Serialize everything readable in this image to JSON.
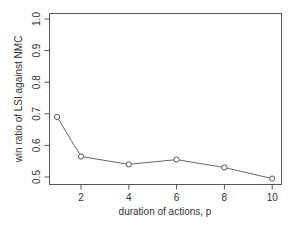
{
  "chart_data": {
    "type": "line",
    "title": "",
    "xlabel": "duration of actions, p",
    "ylabel": "win ratio of LSI against NMC",
    "x": [
      1,
      2,
      4,
      6,
      8,
      10
    ],
    "series": [
      {
        "name": "win ratio",
        "values": [
          0.69,
          0.565,
          0.54,
          0.555,
          0.53,
          0.495
        ]
      }
    ],
    "xticks": [
      2,
      4,
      6,
      8,
      10
    ],
    "xtick_labels": [
      "2",
      "4",
      "6",
      "8",
      "10"
    ],
    "yticks": [
      0.5,
      0.6,
      0.7,
      0.8,
      0.9,
      1.0
    ],
    "ytick_labels": [
      "0.5",
      "0.6",
      "0.7",
      "0.8",
      "0.9",
      "1.0"
    ],
    "xlim": [
      0.7,
      10.4
    ],
    "ylim": [
      0.48,
      1.02
    ],
    "grid": false,
    "legend": null,
    "marker": "open-circle",
    "line_color": "#555555",
    "axis_color": "#555555"
  }
}
